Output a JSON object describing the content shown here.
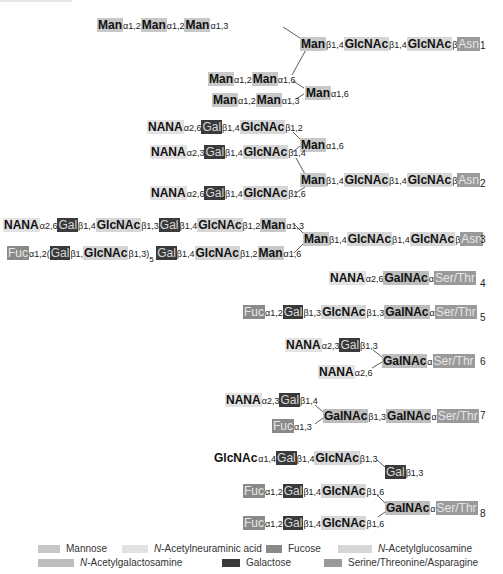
{
  "title_fragment": "",
  "colors": {
    "mannose": "#c8c8c8",
    "nana": "#e2e2e2",
    "fucose": "#8a8a8a",
    "glcnac": "#d6d6d6",
    "galnac": "#bdbdbd",
    "galactose": "#3a3a3a",
    "amino_acid": "#9a9a9a"
  },
  "structures": [
    {
      "number": "1",
      "rows": [
        [
          {
            "t": "Man",
            "k": "man"
          },
          {
            "l": "α1,2"
          },
          {
            "t": "Man",
            "k": "man"
          },
          {
            "l": "α1,2"
          },
          {
            "t": "Man",
            "k": "man"
          },
          {
            "l": "α1,3"
          }
        ],
        [
          {
            "t": "Man",
            "k": "man"
          },
          {
            "l": "β1,4"
          },
          {
            "t": "GlcNAc",
            "k": "glcnac"
          },
          {
            "l": "β1,4"
          },
          {
            "t": "GlcNAc",
            "k": "glcnac"
          },
          {
            "l": "β"
          },
          {
            "t": "Asn",
            "k": "aa"
          }
        ],
        [
          {
            "t": "Man",
            "k": "man"
          },
          {
            "l": "α1,2"
          },
          {
            "t": "Man",
            "k": "man"
          },
          {
            "l": "α1,6"
          }
        ],
        [
          {
            "t": "Man",
            "k": "man"
          },
          {
            "l": "α1,6"
          }
        ],
        [
          {
            "t": "Man",
            "k": "man"
          },
          {
            "l": "α1,2"
          },
          {
            "t": "Man",
            "k": "man"
          },
          {
            "l": "α1,3"
          }
        ]
      ]
    },
    {
      "number": "2",
      "rows": [
        [
          {
            "t": "NANA",
            "k": "nana"
          },
          {
            "l": "α2,6"
          },
          {
            "t": "Gal",
            "k": "gal"
          },
          {
            "l": "β1,4"
          },
          {
            "t": "GlcNAc",
            "k": "glcnac"
          },
          {
            "l": "β1,2"
          }
        ],
        [
          {
            "t": "Man",
            "k": "man"
          },
          {
            "l": "α1,6"
          }
        ],
        [
          {
            "t": "NANA",
            "k": "nana"
          },
          {
            "l": "α2,3"
          },
          {
            "t": "Gal",
            "k": "gal"
          },
          {
            "l": "β1,4"
          },
          {
            "t": "GlcNAc",
            "k": "glcnac"
          },
          {
            "l": "β1,4"
          }
        ],
        [
          {
            "t": "Man",
            "k": "man"
          },
          {
            "l": "β1,4"
          },
          {
            "t": "GlcNAc",
            "k": "glcnac"
          },
          {
            "l": "β1,4"
          },
          {
            "t": "GlcNAc",
            "k": "glcnac"
          },
          {
            "l": "β"
          },
          {
            "t": "Asn",
            "k": "aa"
          }
        ],
        [
          {
            "t": "NANA",
            "k": "nana"
          },
          {
            "l": "α2,6"
          },
          {
            "t": "Gal",
            "k": "gal"
          },
          {
            "l": "β1,4"
          },
          {
            "t": "GlcNAc",
            "k": "glcnac"
          },
          {
            "l": "β1,6"
          }
        ]
      ]
    },
    {
      "number": "3",
      "rows": [
        [
          {
            "t": "NANA",
            "k": "nana"
          },
          {
            "l": "α2,6"
          },
          {
            "t": "Gal",
            "k": "gal"
          },
          {
            "l": "β1,4"
          },
          {
            "t": "GlcNAc",
            "k": "glcnac"
          },
          {
            "l": "β1,3"
          },
          {
            "t": "Gal",
            "k": "gal"
          },
          {
            "l": "β1,4"
          },
          {
            "t": "GlcNAc",
            "k": "glcnac"
          },
          {
            "l": "β1,2"
          },
          {
            "t": "Man",
            "k": "man"
          },
          {
            "l": "α1,3"
          }
        ],
        [
          {
            "t": "Man",
            "k": "man"
          },
          {
            "l": "β1,4"
          },
          {
            "t": "GlcNAc",
            "k": "glcnac"
          },
          {
            "l": "β1,4"
          },
          {
            "t": "GlcNAc",
            "k": "glcnac"
          },
          {
            "l": "β"
          },
          {
            "t": "Asn",
            "k": "aa"
          }
        ],
        [
          {
            "t": "Fuc",
            "k": "fuc"
          },
          {
            "l": "α1,2("
          },
          {
            "t": "Gal",
            "k": "gal"
          },
          {
            "l": "β1,"
          },
          {
            "t": "GlcNAc",
            "k": "glcnac"
          },
          {
            "l": "β1,3)"
          },
          {
            "sub": "5"
          },
          {
            "l": " "
          },
          {
            "t": "Gal",
            "k": "gal"
          },
          {
            "l": "β1,4"
          },
          {
            "t": "GlcNAc",
            "k": "glcnac"
          },
          {
            "l": "β1,2"
          },
          {
            "t": "Man",
            "k": "man"
          },
          {
            "l": "α1,6"
          }
        ]
      ]
    },
    {
      "number": "4",
      "rows": [
        [
          {
            "t": "NANA",
            "k": "nana"
          },
          {
            "l": "α2,6"
          },
          {
            "t": "GalNAc",
            "k": "galnac"
          },
          {
            "l": "α"
          },
          {
            "t": "Ser/Thr",
            "k": "aa"
          }
        ]
      ]
    },
    {
      "number": "5",
      "rows": [
        [
          {
            "t": "Fuc",
            "k": "fuc"
          },
          {
            "l": "α1,2"
          },
          {
            "t": "Gal",
            "k": "gal"
          },
          {
            "l": "β1,3"
          },
          {
            "t": "GlcNAc",
            "k": "glcnac"
          },
          {
            "l": "β1,3"
          },
          {
            "t": "GalNAc",
            "k": "galnac"
          },
          {
            "l": "α"
          },
          {
            "t": "Ser/Thr",
            "k": "aa"
          }
        ]
      ]
    },
    {
      "number": "6",
      "rows": [
        [
          {
            "t": "NANA",
            "k": "nana"
          },
          {
            "l": "α2,3"
          },
          {
            "t": "Gal",
            "k": "gal"
          },
          {
            "l": "β1,3"
          }
        ],
        [
          {
            "t": "GalNAc",
            "k": "galnac"
          },
          {
            "l": "α"
          },
          {
            "t": "Ser/Thr",
            "k": "aa"
          }
        ],
        [
          {
            "t": "NANA",
            "k": "nana"
          },
          {
            "l": "α2,6"
          }
        ]
      ]
    },
    {
      "number": "7",
      "rows": [
        [
          {
            "t": "NANA",
            "k": "nana"
          },
          {
            "l": "α2,3"
          },
          {
            "t": "Gal",
            "k": "gal"
          },
          {
            "l": "β1,4"
          }
        ],
        [
          {
            "t": "GalNAc",
            "k": "galnac"
          },
          {
            "l": "β1,3"
          },
          {
            "t": "GalNAc",
            "k": "galnac"
          },
          {
            "l": "α"
          },
          {
            "t": "Ser/Thr",
            "k": "aa"
          }
        ],
        [
          {
            "t": "Fuc",
            "k": "fuc"
          },
          {
            "l": "α1,3"
          }
        ]
      ]
    },
    {
      "number": "8",
      "rows": [
        [
          {
            "t": "GlcNAc",
            "k": "plain"
          },
          {
            "l": "α1,4"
          },
          {
            "t": "Gal",
            "k": "gal"
          },
          {
            "l": "β1,4"
          },
          {
            "t": "GlcNAc",
            "k": "glcnac"
          },
          {
            "l": "β1,3"
          }
        ],
        [
          {
            "t": "Gal",
            "k": "gal"
          },
          {
            "l": "β1,3"
          }
        ],
        [
          {
            "t": "Fuc",
            "k": "fuc"
          },
          {
            "l": "α1,2"
          },
          {
            "t": "Gal",
            "k": "gal"
          },
          {
            "l": "β1,4"
          },
          {
            "t": "GlcNAc",
            "k": "glcnac"
          },
          {
            "l": "β1,6"
          }
        ],
        [
          {
            "t": "GalNAc",
            "k": "galnac"
          },
          {
            "l": "α"
          },
          {
            "t": "Ser/Thr",
            "k": "aa"
          }
        ],
        [
          {
            "t": "Fuc",
            "k": "fuc"
          },
          {
            "l": "α1,2"
          },
          {
            "t": "Gal",
            "k": "gal"
          },
          {
            "l": "β1,4"
          },
          {
            "t": "GlcNAc",
            "k": "glcnac"
          },
          {
            "l": "β1,6"
          }
        ]
      ]
    }
  ],
  "legend": [
    {
      "label": "Mannose",
      "key": "mannose",
      "italic_prefix": ""
    },
    {
      "label": "-Acetylneuraminic acid",
      "key": "nana",
      "italic_prefix": "N"
    },
    {
      "label": "Fucose",
      "key": "fucose",
      "italic_prefix": ""
    },
    {
      "label": "-Acetylglucosamine",
      "key": "glcnac",
      "italic_prefix": "N"
    },
    {
      "label": "-Acetylgalactosamine",
      "key": "galnac",
      "italic_prefix": "N"
    },
    {
      "label": "Galactose",
      "key": "galactose",
      "italic_prefix": ""
    },
    {
      "label": "Serine/Threonine/Asparagine",
      "key": "amino_acid",
      "italic_prefix": ""
    }
  ]
}
